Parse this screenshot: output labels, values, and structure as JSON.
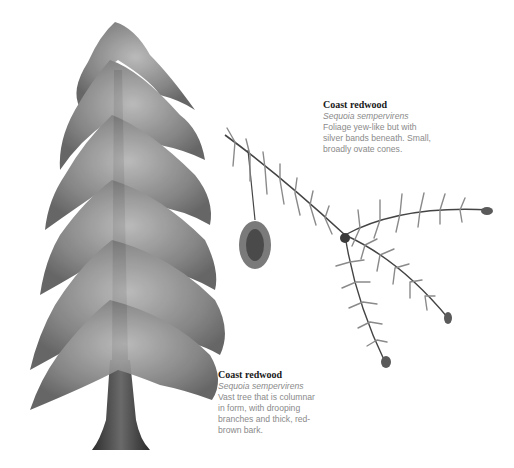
{
  "illustrations": [
    {
      "name": "tree",
      "description": "Full coast redwood tree illustration"
    },
    {
      "name": "branch",
      "description": "Foliage spray with cones"
    }
  ],
  "captions": {
    "branch": {
      "title": "Coast redwood",
      "scientific_name": "Sequoia sempervirens",
      "lines": [
        "Foliage yew-like but with",
        "silver bands beneath. Small,",
        "broadly ovate cones."
      ]
    },
    "tree": {
      "title": "Coast redwood",
      "scientific_name": "Sequoia sempervirens",
      "lines": [
        "Vast tree that is columnar",
        "in form, with drooping",
        "branches and thick, red-",
        "brown bark."
      ]
    }
  },
  "colors": {
    "background": "#ffffff",
    "title": "#1a1a1a",
    "body_text": "#8a8a8a",
    "foliage": "#777777",
    "trunk": "#3a3a3a"
  }
}
